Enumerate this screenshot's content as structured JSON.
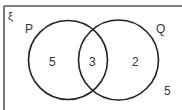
{
  "diagram": {
    "type": "venn",
    "universal_set_symbol": "ξ",
    "sets": [
      {
        "name": "P",
        "label": "P"
      },
      {
        "name": "Q",
        "label": "Q"
      }
    ],
    "regions": {
      "p_only": "5",
      "p_and_q": "3",
      "q_only": "2",
      "outside": "5"
    },
    "colors": {
      "frame": "#555555",
      "circle": "#222222",
      "text": "#333333",
      "background": "#ffffff"
    }
  }
}
